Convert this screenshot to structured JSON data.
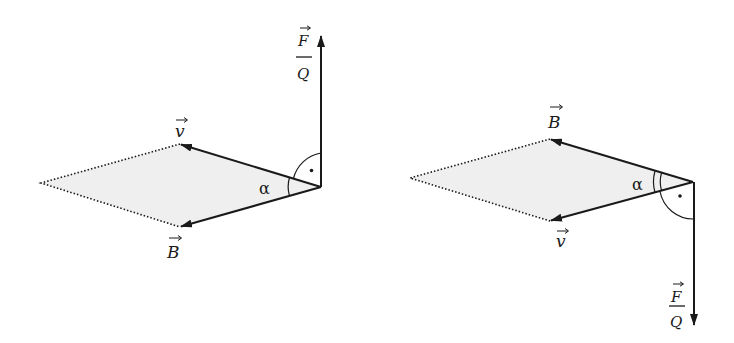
{
  "figures": [
    {
      "id": "left",
      "labels": {
        "v": "v",
        "B": "B",
        "F": "F",
        "Q": "Q",
        "angle": "α"
      },
      "right_angle_marker": "·"
    },
    {
      "id": "right",
      "labels": {
        "v": "v",
        "B": "B",
        "F": "F",
        "Q": "Q",
        "angle": "α"
      },
      "right_angle_marker": "·"
    }
  ],
  "colors": {
    "stroke": "#1a1a1a",
    "fill": "#efefef",
    "background": "#ffffff"
  }
}
